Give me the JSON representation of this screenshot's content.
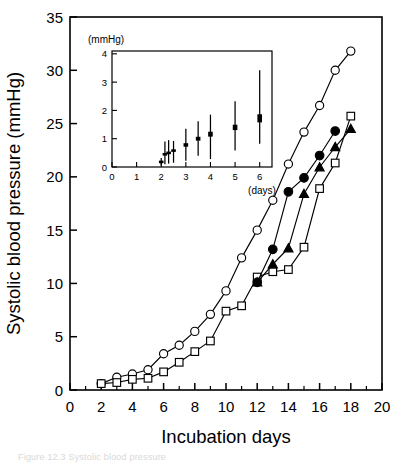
{
  "figure": {
    "caption_fragment": "Figure 12.3  Systolic blood pressure"
  },
  "main_axes": {
    "x_title": "Incubation days",
    "y_title": "Systolic blood pressure (mmHg)",
    "x_ticklabels": [
      "0",
      "2",
      "4",
      "6",
      "8",
      "10",
      "12",
      "14",
      "16",
      "18",
      "20"
    ],
    "y_ticklabels": [
      "0",
      "5",
      "10",
      "15",
      "20",
      "25",
      "30",
      "35"
    ]
  },
  "inset_axes": {
    "y_unit_label": "(mmHg)",
    "x_unit_label": "(days)",
    "x_ticklabels": [
      "0",
      "1",
      "2",
      "3",
      "4",
      "5",
      "6"
    ],
    "y_ticklabels": [
      "0",
      "1",
      "2",
      "3",
      "4"
    ]
  },
  "chart_data": [
    {
      "id": "main",
      "type": "line",
      "title": "",
      "xlabel": "Incubation days",
      "ylabel": "Systolic blood pressure (mmHg)",
      "xlim": [
        0,
        20
      ],
      "ylim": [
        0,
        35
      ],
      "xticks": [
        0,
        2,
        4,
        6,
        8,
        10,
        12,
        14,
        16,
        18,
        20
      ],
      "xminorticks": [
        1,
        3,
        5,
        7,
        9,
        11,
        13,
        15,
        17,
        19
      ],
      "yticks": [
        0,
        5,
        10,
        15,
        20,
        25,
        30,
        35
      ],
      "grid": false,
      "legend": "none",
      "series": [
        {
          "name": "open-circle",
          "marker": "open-circle",
          "x": [
            2,
            3,
            4,
            5,
            6,
            7,
            8,
            9,
            10,
            11,
            12,
            13,
            14,
            15,
            16,
            17,
            18
          ],
          "y": [
            0.6,
            1.2,
            1.5,
            1.9,
            3.4,
            4.2,
            5.5,
            7.1,
            9.3,
            12.4,
            15.0,
            17.8,
            21.2,
            24.2,
            26.7,
            30.0,
            31.8
          ]
        },
        {
          "name": "open-square",
          "marker": "open-square",
          "x": [
            2,
            3,
            4,
            5,
            6,
            7,
            8,
            9,
            10,
            11,
            12,
            13,
            14,
            15,
            16,
            17,
            18
          ],
          "y": [
            0.6,
            0.7,
            1.0,
            1.1,
            1.7,
            2.6,
            3.6,
            4.6,
            7.4,
            7.9,
            10.6,
            11.1,
            11.3,
            13.4,
            18.9,
            21.3,
            25.7
          ]
        },
        {
          "name": "filled-circle",
          "marker": "filled-circle",
          "x": [
            12,
            13,
            14,
            15,
            16,
            17
          ],
          "y": [
            10.1,
            13.2,
            18.6,
            19.9,
            22.0,
            24.3
          ]
        },
        {
          "name": "filled-triangle",
          "marker": "filled-triangle",
          "x": [
            12,
            13,
            14,
            15,
            16,
            17,
            18
          ],
          "y": [
            10.1,
            11.8,
            13.3,
            18.4,
            20.9,
            22.8,
            24.5
          ]
        }
      ]
    },
    {
      "id": "inset",
      "type": "scatter",
      "title": "",
      "xlabel": "(days)",
      "ylabel": "(mmHg)",
      "xlim": [
        0,
        6.5
      ],
      "ylim": [
        0,
        4.1
      ],
      "xticks": [
        0,
        1,
        2,
        3,
        4,
        5,
        6
      ],
      "yticks": [
        0,
        1,
        2,
        3,
        4
      ],
      "grid": false,
      "legend": "none",
      "errorbars": [
        {
          "x": 2.0,
          "y": 0.18,
          "low": 0.05,
          "high": 0.32
        },
        {
          "x": 2.15,
          "y": 0.45,
          "low": 0.1,
          "high": 0.9
        },
        {
          "x": 2.3,
          "y": 0.5,
          "low": 0.12,
          "high": 0.95
        },
        {
          "x": 2.5,
          "y": 0.58,
          "low": 0.15,
          "high": 0.92
        },
        {
          "x": 3.0,
          "y": 0.78,
          "low": 0.22,
          "high": 1.35
        },
        {
          "x": 3.5,
          "y": 1.0,
          "low": 0.4,
          "high": 1.62
        },
        {
          "x": 4.0,
          "y": 1.16,
          "low": 0.28,
          "high": 1.85
        },
        {
          "x": 5.0,
          "y": 1.4,
          "low": 0.58,
          "high": 2.32
        },
        {
          "x": 6.0,
          "y": 1.72,
          "low": 0.82,
          "high": 3.42
        }
      ]
    }
  ]
}
